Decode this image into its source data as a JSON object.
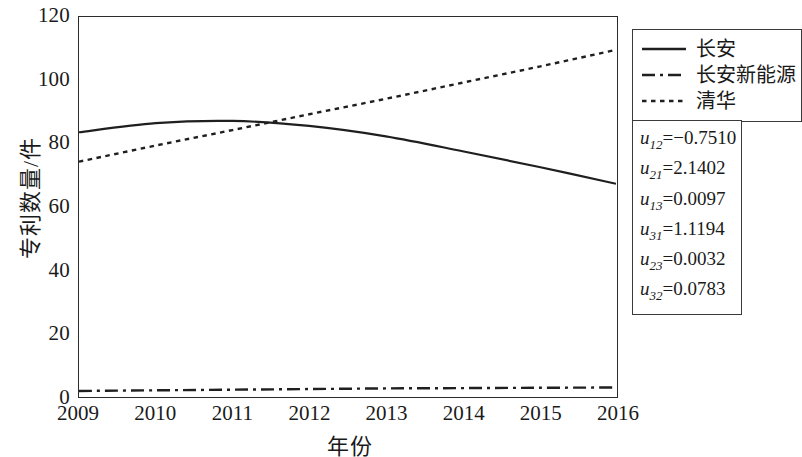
{
  "chart_data": {
    "type": "line",
    "title": "",
    "xlabel": "年份",
    "ylabel": "专利数量/件",
    "xlim": [
      2009,
      2016
    ],
    "ylim": [
      0,
      120
    ],
    "xticks": [
      "2009",
      "2010",
      "2011",
      "2012",
      "2013",
      "2014",
      "2015",
      "2016"
    ],
    "yticks": [
      "0",
      "20",
      "40",
      "60",
      "80",
      "100",
      "120"
    ],
    "grid": false,
    "legend_position": "outside-right-top",
    "x": [
      2009,
      2010,
      2011,
      2012,
      2013,
      2014,
      2015,
      2016
    ],
    "series": [
      {
        "name": "长安",
        "style": "solid",
        "color": "#1f1f1f",
        "values": [
          83.5,
          86.4,
          87.1,
          85.5,
          82.2,
          77.5,
          72.5,
          67.2
        ]
      },
      {
        "name": "长安新能源",
        "style": "dashdot",
        "color": "#1f1f1f",
        "values": [
          1.6,
          1.8,
          2.0,
          2.2,
          2.4,
          2.5,
          2.6,
          2.7
        ]
      },
      {
        "name": "清华",
        "style": "dotted",
        "color": "#1f1f1f",
        "values": [
          74.2,
          79.3,
          84.2,
          89.2,
          94.1,
          99.2,
          104.3,
          109.6
        ]
      }
    ],
    "annotations": {
      "params_box": [
        {
          "symbol": "u",
          "sub": "12",
          "value": "=−0.7510"
        },
        {
          "symbol": "u",
          "sub": "21",
          "value": "=2.1402"
        },
        {
          "symbol": "u",
          "sub": "13",
          "value": "=0.0097"
        },
        {
          "symbol": "u",
          "sub": "31",
          "value": "=1.1194"
        },
        {
          "symbol": "u",
          "sub": "23",
          "value": "=0.0032"
        },
        {
          "symbol": "u",
          "sub": "32",
          "value": "=0.0783"
        }
      ]
    }
  },
  "axes": {
    "xlabel": "年份",
    "ylabel": "专利数量/件",
    "yticks": [
      "120",
      "100",
      "80",
      "60",
      "40",
      "20",
      "0"
    ],
    "xticks": [
      "2009",
      "2010",
      "2011",
      "2012",
      "2013",
      "2014",
      "2015",
      "2016"
    ]
  },
  "legend": {
    "items": [
      {
        "label": "长安",
        "style": "solid"
      },
      {
        "label": "长安新能源",
        "style": "dashdot"
      },
      {
        "label": "清华",
        "style": "dotted"
      }
    ]
  },
  "params": {
    "rows": [
      {
        "sym": "u",
        "sub": "12",
        "val": "=−0.7510"
      },
      {
        "sym": "u",
        "sub": "21",
        "val": "=2.1402"
      },
      {
        "sym": "u",
        "sub": "13",
        "val": "=0.0097"
      },
      {
        "sym": "u",
        "sub": "31",
        "val": "=1.1194"
      },
      {
        "sym": "u",
        "sub": "23",
        "val": "=0.0032"
      },
      {
        "sym": "u",
        "sub": "32",
        "val": "=0.0783"
      }
    ]
  }
}
